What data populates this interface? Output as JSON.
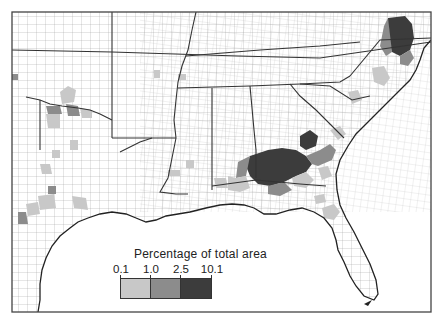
{
  "map": {
    "region": "Southeastern United States (county level)",
    "frame_color": "#444444",
    "land_color": "#ffffff",
    "county_line_color": "#8a8a8a",
    "state_line_color": "#333333"
  },
  "legend": {
    "title": "Percentage of total area",
    "ticks": [
      "0.1",
      "1.0",
      "2.5",
      "10.1"
    ],
    "classes": [
      {
        "range": "0.1–1.0",
        "color": "#c8c8c8"
      },
      {
        "range": "1.0–2.5",
        "color": "#8c8c8c"
      },
      {
        "range": "2.5–10.1",
        "color": "#3c3c3c"
      }
    ]
  },
  "shaded_areas": [
    {
      "label": "Northeastern North Carolina / SE Virginia",
      "class": "2.5–10.1"
    },
    {
      "label": "Southern Georgia / SE Alabama",
      "class": "2.5–10.1"
    },
    {
      "label": "Coastal Georgia / South Carolina",
      "class": "1.0–2.5"
    },
    {
      "label": "Red River, Oklahoma–Texas border",
      "class": "1.0–2.5"
    },
    {
      "label": "Central Texas",
      "class": "0.1–1.0"
    },
    {
      "label": "North-central Florida",
      "class": "0.1–1.0"
    }
  ]
}
